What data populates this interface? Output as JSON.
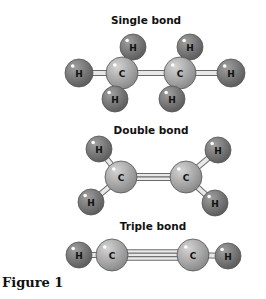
{
  "figure_label": "Figure 1",
  "colors": {
    "carbon": "#a9a9a9",
    "hydrogen": "#7b7b7b",
    "bond": "#e8e8e8",
    "bond_stroke": "#6a6a6a"
  },
  "molecules": [
    {
      "title": "Single bond",
      "title_pos": [
        146,
        20
      ],
      "atoms": [
        {
          "el": "H",
          "x": 79,
          "y": 73,
          "r": 14
        },
        {
          "el": "C",
          "x": 122,
          "y": 73,
          "r": 16
        },
        {
          "el": "H",
          "x": 133,
          "y": 47,
          "r": 13
        },
        {
          "el": "H",
          "x": 115,
          "y": 99,
          "r": 13
        },
        {
          "el": "C",
          "x": 180,
          "y": 73,
          "r": 16
        },
        {
          "el": "H",
          "x": 190,
          "y": 47,
          "r": 13
        },
        {
          "el": "H",
          "x": 172,
          "y": 99,
          "r": 13
        },
        {
          "el": "H",
          "x": 231,
          "y": 73,
          "r": 14
        }
      ],
      "bonds": [
        [
          0,
          1,
          1
        ],
        [
          1,
          4,
          1
        ],
        [
          4,
          7,
          1
        ]
      ]
    },
    {
      "title": "Double bond",
      "title_pos": [
        151,
        130
      ],
      "atoms": [
        {
          "el": "H",
          "x": 99,
          "y": 149,
          "r": 13
        },
        {
          "el": "H",
          "x": 91,
          "y": 202,
          "r": 13
        },
        {
          "el": "C",
          "x": 121,
          "y": 177,
          "r": 16
        },
        {
          "el": "C",
          "x": 186,
          "y": 177,
          "r": 16
        },
        {
          "el": "H",
          "x": 218,
          "y": 150,
          "r": 13
        },
        {
          "el": "H",
          "x": 215,
          "y": 203,
          "r": 13
        }
      ],
      "bonds": [
        [
          0,
          2,
          1
        ],
        [
          1,
          2,
          1
        ],
        [
          2,
          3,
          2
        ],
        [
          3,
          4,
          1
        ],
        [
          3,
          5,
          1
        ]
      ]
    },
    {
      "title": "Triple bond",
      "title_pos": [
        153,
        226
      ],
      "atoms": [
        {
          "el": "H",
          "x": 79,
          "y": 255,
          "r": 13
        },
        {
          "el": "C",
          "x": 112,
          "y": 255,
          "r": 16
        },
        {
          "el": "C",
          "x": 193,
          "y": 255,
          "r": 16
        },
        {
          "el": "H",
          "x": 228,
          "y": 256,
          "r": 13
        }
      ],
      "bonds": [
        [
          0,
          1,
          1
        ],
        [
          1,
          2,
          3
        ],
        [
          2,
          3,
          1
        ]
      ]
    }
  ]
}
